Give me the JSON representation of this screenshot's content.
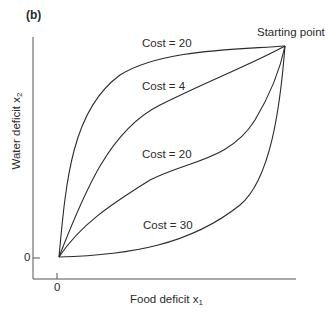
{
  "figure": {
    "panel_label": "(b)",
    "start_label": "Starting point",
    "x_axis": {
      "label": "Food deficit x",
      "subscript": "1",
      "tick": "0"
    },
    "y_axis": {
      "label": "Water deficit x",
      "subscript": "2",
      "tick": "0"
    },
    "curves": [
      {
        "label": "Cost = 20",
        "position": "top"
      },
      {
        "label": "Cost = 4",
        "position": "upper-middle"
      },
      {
        "label": "Cost = 20",
        "position": "lower-middle"
      },
      {
        "label": "Cost = 30",
        "position": "bottom"
      }
    ],
    "line_color": "#2a2a2a",
    "axis_color": "#555555"
  }
}
